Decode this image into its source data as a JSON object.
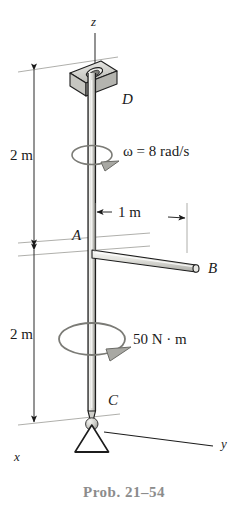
{
  "figure": {
    "caption": "Prob. 21–54",
    "type": "engineering-mechanics-diagram",
    "axes": {
      "x_label": "x",
      "y_label": "y",
      "z_label": "z"
    },
    "points": {
      "D": "D",
      "A": "A",
      "B": "B",
      "C": "C"
    },
    "dimensions": [
      {
        "id": "upper-length",
        "label": "2 m",
        "value": 2,
        "unit": "m"
      },
      {
        "id": "rod-length",
        "label": "1 m",
        "value": 1,
        "unit": "m"
      },
      {
        "id": "lower-length",
        "label": "2 m",
        "value": 2,
        "unit": "m"
      }
    ],
    "annotations": {
      "angular_velocity": "ω = 8 rad/s",
      "angular_velocity_value": 8,
      "angular_velocity_unit": "rad/s",
      "torque": "50 N · m",
      "torque_value": 50,
      "torque_unit": "N·m"
    },
    "colors": {
      "line": "#1a1a1a",
      "shaft_fill": "#dcdcd8",
      "bearing_fill": "#d4d4d0",
      "caption": "#8c8c8c",
      "construction_line": "#8a8a8a",
      "arc": "#6e6e6e"
    }
  }
}
